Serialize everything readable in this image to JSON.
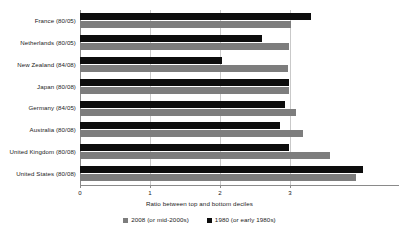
{
  "chart_data": {
    "type": "bar",
    "orientation": "horizontal",
    "title": "",
    "xlabel": "Ratio between top and bottom deciles",
    "ylabel": "",
    "xlim": [
      0,
      4.557
    ],
    "xticks": [
      0,
      1,
      2,
      3
    ],
    "xtick_labels": [
      "0",
      "1",
      "2",
      "3"
    ],
    "grid": "vertical",
    "legend_position": "bottom-center",
    "categories": [
      "France (80/05)",
      "Netherlands (80/05)",
      "New Zealand (84/08)",
      "Japan (80/08)",
      "Germany (84/05)",
      "Australia (80/08)",
      "United Kingdom (80/08)",
      "United States (80/08)"
    ],
    "series": [
      {
        "name": "1980 (or early 1980s)",
        "key": "old",
        "color": "#0d0d0d",
        "values": [
          3.3,
          2.6,
          2.03,
          2.99,
          2.93,
          2.86,
          2.99,
          4.04
        ]
      },
      {
        "name": "2008 (or mid-2000s)",
        "key": "new",
        "color": "#7d7d7d",
        "values": [
          3.01,
          2.99,
          2.97,
          2.99,
          3.09,
          3.19,
          3.57,
          3.94
        ]
      }
    ],
    "legend": [
      {
        "label": "2008 (or mid-2000s)",
        "color": "#7d7d7d"
      },
      {
        "label": "1980 (or early 1980s)",
        "color": "#0d0d0d"
      }
    ]
  },
  "colors": {
    "background": "#ffffff",
    "grid": "#c9c9c9",
    "axis": "#8a8a8a",
    "text": "#1a1a1a",
    "series_old": "#0d0d0d",
    "series_new": "#7d7d7d"
  }
}
